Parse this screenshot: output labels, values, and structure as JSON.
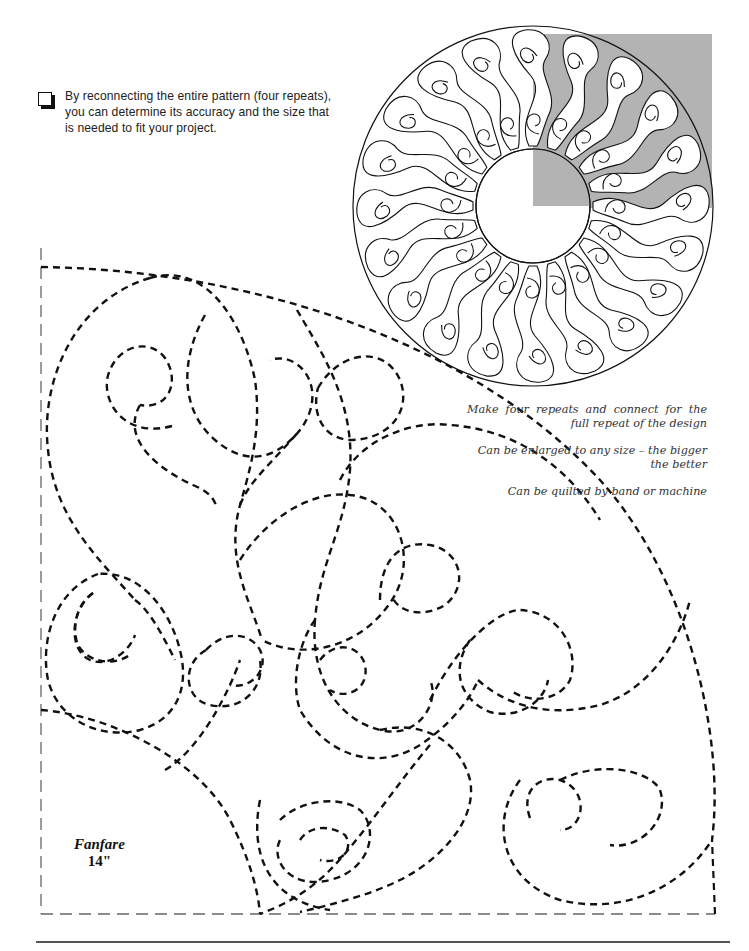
{
  "tip": {
    "icon": "checkbox-icon",
    "text": "By reconnecting the entire pattern (four repeats), you can determine its accuracy and the size that is needed to fit your project."
  },
  "diagram": {
    "highlight_color": "#b3b3b3",
    "repeats": 4,
    "swirls_per_ring": 20
  },
  "notes": [
    "Make four repeats and connect for the full repeat of the design",
    "Can be enlarged to any size – the bigger the better",
    "Can be quilted by band or machine"
  ],
  "pattern": {
    "name": "Fanfare",
    "size": "14\""
  }
}
